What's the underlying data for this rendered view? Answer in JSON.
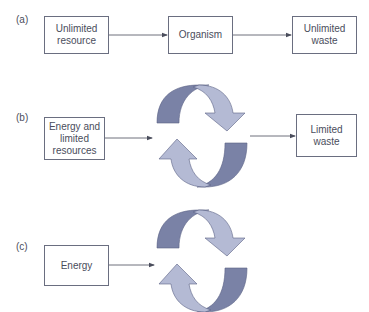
{
  "colors": {
    "box_border": "#6a6e80",
    "text": "#4a4d5c",
    "arrow_line": "#4a4d5c",
    "cycle_dark": "#7a82a6",
    "cycle_light": "#b4bad4",
    "cycle_outline": "#5a6185"
  },
  "panel_a": {
    "label": "(a)",
    "boxes": [
      {
        "text": "Unlimited resource"
      },
      {
        "text": "Organism"
      },
      {
        "text": "Unlimited waste"
      }
    ]
  },
  "panel_b": {
    "label": "(b)",
    "input_box": "Energy and limited resources",
    "output_box": "Limited waste",
    "cycle_icon": "recycling-cycle-arrows"
  },
  "panel_c": {
    "label": "(c)",
    "input_box": "Energy",
    "cycle_icon": "recycling-cycle-arrows"
  }
}
